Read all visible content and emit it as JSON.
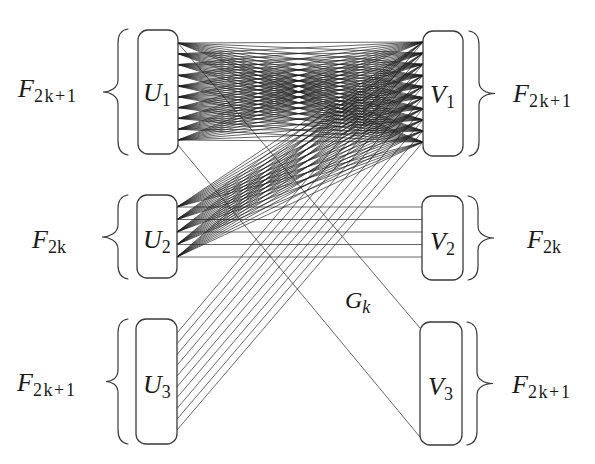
{
  "figure": {
    "graph_label": {
      "main": "G",
      "sub": "k"
    },
    "left_parts": [
      {
        "name": "U1",
        "label": {
          "main": "U",
          "sub": "1"
        },
        "size": {
          "main": "F",
          "sub": "2k+1"
        },
        "points": 10
      },
      {
        "name": "U2",
        "label": {
          "main": "U",
          "sub": "2"
        },
        "size": {
          "main": "F",
          "sub": "2k"
        },
        "points": 5
      },
      {
        "name": "U3",
        "label": {
          "main": "U",
          "sub": "3"
        },
        "size": {
          "main": "F",
          "sub": "2k+1"
        },
        "points": 10
      }
    ],
    "right_parts": [
      {
        "name": "V1",
        "label": {
          "main": "V",
          "sub": "1"
        },
        "size": {
          "main": "F",
          "sub": "2k+1"
        },
        "points": 10
      },
      {
        "name": "V2",
        "label": {
          "main": "V",
          "sub": "2"
        },
        "size": {
          "main": "F",
          "sub": "2k"
        },
        "points": 5
      },
      {
        "name": "V3",
        "label": {
          "main": "V",
          "sub": "3"
        },
        "size": {
          "main": "F",
          "sub": "2k+1"
        },
        "points": 2
      }
    ],
    "edges": [
      {
        "from": "U1",
        "to": "V1",
        "type": "complete"
      },
      {
        "from": "U2",
        "to": "V1",
        "type": "complete"
      },
      {
        "from": "U2",
        "to": "V2",
        "type": "matching"
      },
      {
        "from": "U3",
        "to": "V1",
        "type": "matching"
      },
      {
        "from": "U1",
        "to": "V3",
        "type": "matching-outline"
      }
    ]
  },
  "colors": {
    "background": "#ffffff",
    "line": "#1e1e1e",
    "box_border": "#3a3a3a",
    "text": "#1a1a1a"
  }
}
